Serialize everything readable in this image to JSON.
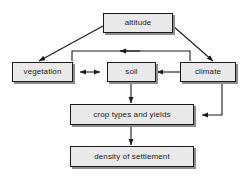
{
  "diagram": {
    "style": {
      "box_fill": "#e9e9e9",
      "box_border": "#1a1a1a",
      "box_shadow": "#8d8d8d",
      "line_color": "#1a1a1a",
      "background": "#ffffff"
    },
    "nodes": [
      {
        "id": "altitude",
        "label": "altitude",
        "x": 103,
        "y": 13,
        "w": 70,
        "h": 20
      },
      {
        "id": "vegetation",
        "label": "vegetation",
        "x": 12,
        "y": 62,
        "w": 61,
        "h": 20
      },
      {
        "id": "soil",
        "label": "soil",
        "x": 107,
        "y": 62,
        "w": 49,
        "h": 20
      },
      {
        "id": "climate",
        "label": "climate",
        "x": 180,
        "y": 62,
        "w": 56,
        "h": 20
      },
      {
        "id": "crop-types-and-yields",
        "label": "crop types and yields",
        "x": 70,
        "y": 104,
        "w": 124,
        "h": 21
      },
      {
        "id": "density-of-settlement",
        "label": "density of settlement",
        "x": 70,
        "y": 146,
        "w": 124,
        "h": 21
      }
    ],
    "edges": [
      {
        "id": "altitude-to-vegetation",
        "from": "altitude",
        "to": "vegetation",
        "kind": "diagonal",
        "arrowheads": 1
      },
      {
        "id": "altitude-to-climate",
        "from": "altitude",
        "to": "climate",
        "kind": "diagonal",
        "arrowheads": 1
      },
      {
        "id": "vegetation-soil-bidirectional",
        "from": "vegetation",
        "to": "soil",
        "kind": "horizontal",
        "arrowheads": 2
      },
      {
        "id": "climate-to-soil",
        "from": "climate",
        "to": "soil",
        "kind": "horizontal",
        "arrowheads": 1
      },
      {
        "id": "climate-to-vegetation-top-loop",
        "from": "climate",
        "to": "vegetation",
        "kind": "orthogonal-top-loop",
        "arrowheads": 1
      },
      {
        "id": "soil-to-crop-types",
        "from": "soil",
        "to": "crop-types-and-yields",
        "kind": "vertical",
        "arrowheads": 1
      },
      {
        "id": "climate-to-crop-types",
        "from": "climate",
        "to": "crop-types-and-yields",
        "kind": "orthogonal-right",
        "arrowheads": 1
      },
      {
        "id": "crop-types-to-density",
        "from": "crop-types-and-yields",
        "to": "density-of-settlement",
        "kind": "vertical",
        "arrowheads": 1
      }
    ]
  }
}
